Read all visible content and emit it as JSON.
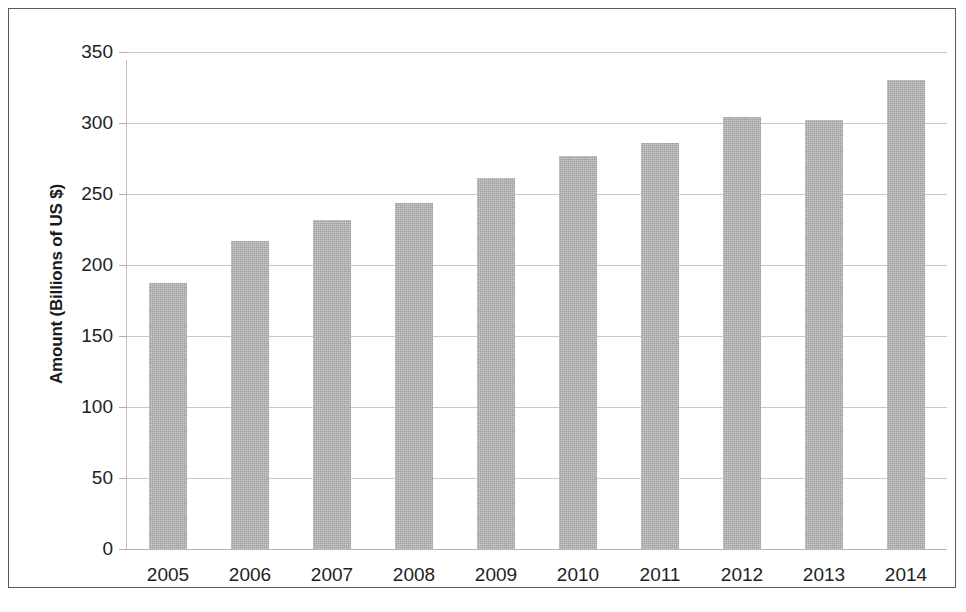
{
  "chart_data": {
    "type": "bar",
    "title": "",
    "xlabel": "",
    "ylabel": "Amount (Billions of US $)",
    "categories": [
      "2005",
      "2006",
      "2007",
      "2008",
      "2009",
      "2010",
      "2011",
      "2012",
      "2013",
      "2014"
    ],
    "values": [
      187,
      217,
      232,
      244,
      261,
      277,
      286,
      304,
      302,
      330
    ],
    "series": [
      {
        "name": "Amount",
        "values": [
          187,
          217,
          232,
          244,
          261,
          277,
          286,
          304,
          302,
          330
        ]
      }
    ],
    "ylim": [
      0,
      350
    ],
    "y_ticks": [
      0,
      50,
      100,
      150,
      200,
      250,
      300,
      350
    ],
    "y_tick_labels": [
      "0",
      "50",
      "100",
      "150",
      "200",
      "250",
      "300",
      "350"
    ],
    "grid": true,
    "legend": false,
    "legend_position": "none",
    "bar_color": "#b2b2b2",
    "gridline_color": "#c8c8c8",
    "axis_text_color": "#222222",
    "frame_color": "#5a5a5a",
    "background_color": "#ffffff"
  }
}
